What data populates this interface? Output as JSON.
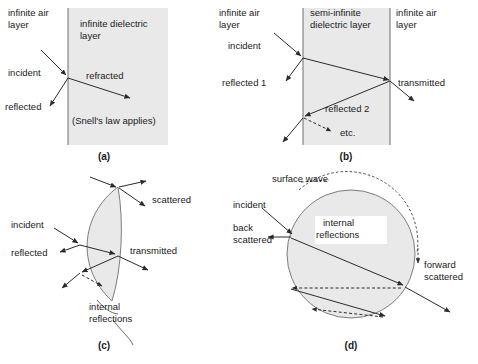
{
  "figure": {
    "title_visible": false,
    "background": "#ffffff",
    "media_fill": "#e9e9e9",
    "line_color": "#2b2b2b",
    "boundary_color": "#6e6e6e"
  },
  "panels": [
    {
      "id": "a",
      "caption": "(a)",
      "labels": {
        "left_medium": "infinite air\nlayer",
        "left_medium_line1": "infinite air",
        "left_medium_line2": "layer",
        "right_medium_line1": "infinite dielectric",
        "right_medium_line2": "layer",
        "incident": "incident",
        "reflected": "reflected",
        "refracted": "refracted",
        "note": "(Snell's law applies)"
      }
    },
    {
      "id": "b",
      "caption": "(b)",
      "labels": {
        "left_medium_line1": "infinite air",
        "left_medium_line2": "layer",
        "slab_line1": "semi-infinite",
        "slab_line2": "dielectric layer",
        "right_medium_line1": "infinite air",
        "right_medium_line2": "layer",
        "incident": "incident",
        "reflected_1": "reflected 1",
        "reflected_2": "reflected 2",
        "transmitted": "transmitted",
        "etc": "etc."
      }
    },
    {
      "id": "c",
      "caption": "(c)",
      "labels": {
        "incident": "incident",
        "reflected": "reflected",
        "scattered": "scattered",
        "transmitted": "transmitted",
        "internal_line1": "internal",
        "internal_line2": "reflections"
      }
    },
    {
      "id": "d",
      "caption": "(d)",
      "labels": {
        "surface_wave": "surface wave",
        "incident": "incident",
        "back_scattered_line1": "back",
        "back_scattered_line2": "scattered",
        "internal_line1": "internal",
        "internal_line2": "reflections",
        "forward_line1": "forward",
        "forward_line2": "scattered"
      }
    }
  ]
}
